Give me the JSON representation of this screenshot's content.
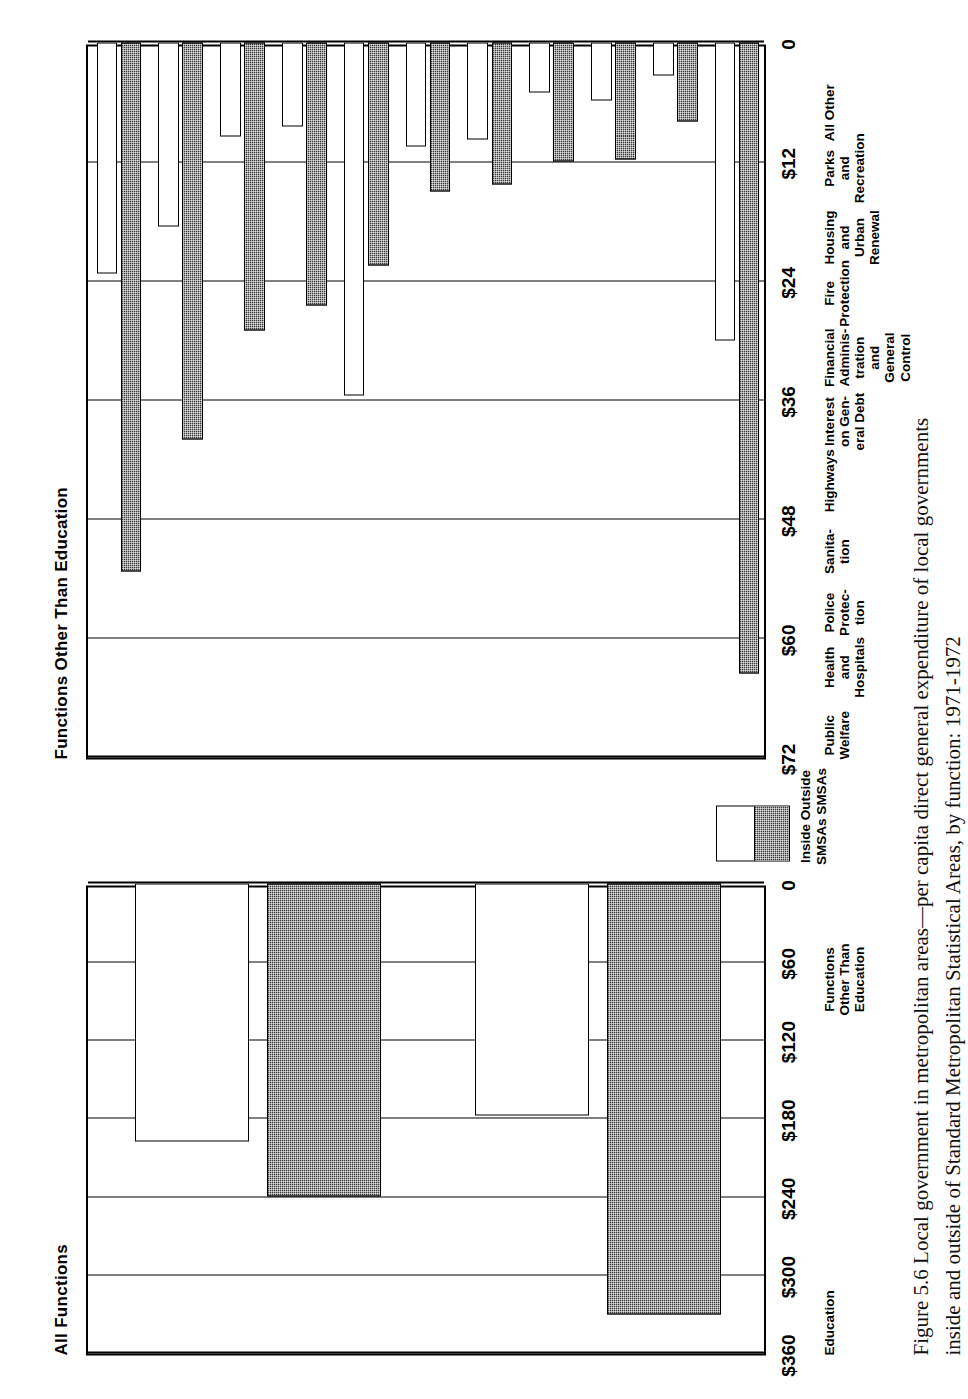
{
  "figure": {
    "caption_line1": "Figure 5.6  Local government in metropolitan areas—per capita direct general expenditure of local governments",
    "caption_line2": "inside and outside of Standard Metropolitan Statistical Areas, by function: 1971-1972"
  },
  "legend": {
    "label": "Inside Outside\nSMSAs SMSAs",
    "inside_name": "Inside SMSAs",
    "outside_name": "Outside SMSAs",
    "inside_color": "#3a3a3a",
    "outside_color": "#ffffff"
  },
  "chart_data": [
    {
      "type": "bar",
      "title": "All Functions",
      "orientation": "horizontal",
      "xlabel": "",
      "ylabel": "",
      "ylim": [
        0,
        360
      ],
      "ticks": [
        "0",
        "$60",
        "$120",
        "$180",
        "$240",
        "$300",
        "$360"
      ],
      "tick_values": [
        0,
        60,
        120,
        180,
        240,
        300,
        360
      ],
      "grid": true,
      "categories": [
        "Education",
        "Functions\nOther Than\nEducation"
      ],
      "series": [
        {
          "name": "Inside SMSAs",
          "values": [
            240,
            330
          ]
        },
        {
          "name": "Outside SMSAs",
          "values": [
            198,
            178
          ]
        }
      ]
    },
    {
      "type": "bar",
      "title": "Functions Other Than Education",
      "orientation": "horizontal",
      "xlabel": "",
      "ylabel": "",
      "ylim": [
        0,
        72
      ],
      "ticks": [
        "0",
        "$12",
        "$24",
        "$36",
        "$48",
        "$60",
        "$72"
      ],
      "tick_values": [
        0,
        12,
        24,
        36,
        48,
        60,
        72
      ],
      "grid": true,
      "categories": [
        "Public\nWelfare",
        "Health\nand\nHospitals",
        "Police\nProtec-\ntion",
        "Sanita-\ntion",
        "Highways",
        "Interest\non Gen-\neral Debt",
        "Financial\nAdminis-\ntration\nand General\nControl",
        "Fire\nProtection",
        "Housing\nand\nUrban\nRenewal",
        "Parks\nand\nRecreation",
        "All Other"
      ],
      "series": [
        {
          "name": "Inside SMSAs",
          "values": [
            53.3,
            40.0,
            29.0,
            26.5,
            22.5,
            15.0,
            14.3,
            12.0,
            11.8,
            8.0,
            63.5
          ]
        },
        {
          "name": "Outside SMSAs",
          "values": [
            23.3,
            18.5,
            9.5,
            8.5,
            35.5,
            10.5,
            9.8,
            5.0,
            5.8,
            3.3,
            30.0
          ]
        }
      ]
    }
  ]
}
